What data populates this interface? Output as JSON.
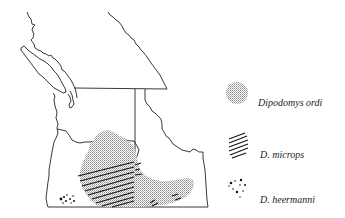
{
  "figure": {
    "type": "species-range-map",
    "region": "Pacific Northwest (British Columbia, Washington, Oregon, Idaho)",
    "colors": {
      "line": "#222222",
      "stipple": "#9a9a9a",
      "background": "#ffffff"
    }
  },
  "legend": {
    "items": [
      {
        "label": "Dipodomys ordi",
        "pattern": "stipple",
        "swatch_icon": "stipple-circle-icon"
      },
      {
        "label": "D. microps",
        "pattern": "hatch",
        "swatch_icon": "diagonal-hatch-icon"
      },
      {
        "label": "D. heermanni",
        "pattern": "dots",
        "swatch_icon": "scattered-dots-icon"
      }
    ]
  }
}
